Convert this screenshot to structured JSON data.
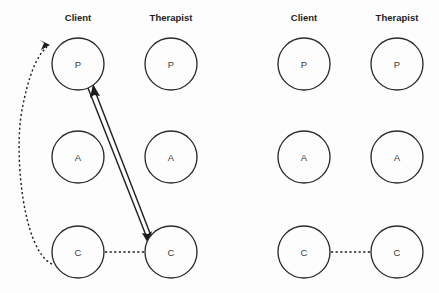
{
  "figure": {
    "background_color": "#fdfdfd",
    "stroke_color": "#1d1d1d",
    "node_fill": "#fdfdfd",
    "width": 439,
    "height": 293
  },
  "panels": [
    {
      "id": "left-panel",
      "columns": [
        {
          "id": "client",
          "label": "Client",
          "label_x": 78,
          "label_y": 21
        },
        {
          "id": "therapist",
          "label": "Therapist",
          "label_x": 171,
          "label_y": 21
        }
      ],
      "nodes": [
        {
          "id": "left-client-p",
          "letter": "P",
          "cx": 78,
          "cy": 64,
          "r": 26
        },
        {
          "id": "left-therapist-p",
          "letter": "P",
          "cx": 171,
          "cy": 64,
          "r": 26
        },
        {
          "id": "left-client-a",
          "letter": "A",
          "cx": 78,
          "cy": 157,
          "r": 26
        },
        {
          "id": "left-therapist-a",
          "letter": "A",
          "cx": 171,
          "cy": 157,
          "r": 26
        },
        {
          "id": "left-client-c",
          "letter": "C",
          "cx": 78,
          "cy": 252,
          "r": 26
        },
        {
          "id": "left-therapist-c",
          "letter": "C",
          "cx": 171,
          "cy": 252,
          "r": 26
        }
      ],
      "links": [
        {
          "id": "client-p-to-therapist-c",
          "style": "solid",
          "direction": "down-right",
          "from": "left-client-p",
          "to": "left-therapist-c",
          "x1": 88,
          "y1": 88,
          "x2": 147,
          "y2": 241,
          "arrow_at": "end"
        },
        {
          "id": "therapist-c-to-client-p",
          "style": "solid",
          "direction": "up-left",
          "from": "left-therapist-c",
          "to": "left-client-p",
          "x1": 153,
          "y1": 241,
          "x2": 94,
          "y2": 88,
          "arrow_at": "end"
        },
        {
          "id": "client-c-to-therapist-c",
          "style": "dotted",
          "direction": "horizontal",
          "from": "left-client-c",
          "to": "left-therapist-c",
          "x1": 105,
          "y1": 252,
          "x2": 145,
          "y2": 252,
          "arrow_at": "none"
        },
        {
          "id": "client-c-to-client-p-curve",
          "style": "dotted-curve",
          "direction": "arc-left",
          "from": "left-client-c",
          "to": "left-client-p",
          "path": "M 52 264 C 22 250 14 150 22 110 C 28 78 36 56 47 47",
          "arrow_at": "end",
          "arrow_x": 50,
          "arrow_y": 45,
          "arrow_angle": -46
        }
      ]
    },
    {
      "id": "right-panel",
      "columns": [
        {
          "id": "client",
          "label": "Client",
          "label_x": 304,
          "label_y": 21
        },
        {
          "id": "therapist",
          "label": "Therapist",
          "label_x": 397,
          "label_y": 21
        }
      ],
      "nodes": [
        {
          "id": "right-client-p",
          "letter": "P",
          "cx": 304,
          "cy": 64,
          "r": 26
        },
        {
          "id": "right-therapist-p",
          "letter": "P",
          "cx": 397,
          "cy": 64,
          "r": 26
        },
        {
          "id": "right-client-a",
          "letter": "A",
          "cx": 304,
          "cy": 157,
          "r": 26
        },
        {
          "id": "right-therapist-a",
          "letter": "A",
          "cx": 397,
          "cy": 157,
          "r": 26
        },
        {
          "id": "right-client-c",
          "letter": "C",
          "cx": 304,
          "cy": 252,
          "r": 26
        },
        {
          "id": "right-therapist-c",
          "letter": "C",
          "cx": 397,
          "cy": 252,
          "r": 26
        }
      ],
      "links": [
        {
          "id": "right-client-c-to-therapist-c",
          "style": "dotted",
          "direction": "horizontal",
          "from": "right-client-c",
          "to": "right-therapist-c",
          "x1": 331,
          "y1": 252,
          "x2": 371,
          "y2": 252,
          "arrow_at": "none"
        }
      ]
    }
  ]
}
